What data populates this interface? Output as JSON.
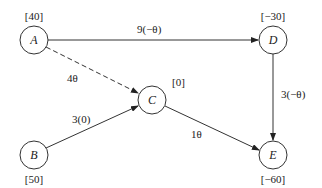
{
  "diagram": {
    "type": "directed-graph",
    "nodes": [
      {
        "id": "A",
        "label": "A",
        "value": "[40]",
        "cx": 34,
        "cy": 40
      },
      {
        "id": "B",
        "label": "B",
        "value": "[50]",
        "cx": 34,
        "cy": 155
      },
      {
        "id": "C",
        "label": "C",
        "value": "[0]",
        "cx": 152,
        "cy": 100
      },
      {
        "id": "D",
        "label": "D",
        "value": "[−30]",
        "cx": 273,
        "cy": 40
      },
      {
        "id": "E",
        "label": "E",
        "value": "[−60]",
        "cx": 273,
        "cy": 155
      }
    ],
    "edges": [
      {
        "from": "A",
        "to": "D",
        "label": "9(−θ)",
        "style": "solid"
      },
      {
        "from": "A",
        "to": "C",
        "label": "4θ",
        "style": "dashed"
      },
      {
        "from": "B",
        "to": "C",
        "label": "3(0)",
        "style": "solid"
      },
      {
        "from": "C",
        "to": "E",
        "label": "1θ",
        "style": "solid"
      },
      {
        "from": "D",
        "to": "E",
        "label": "3(−θ)",
        "style": "solid"
      }
    ]
  }
}
